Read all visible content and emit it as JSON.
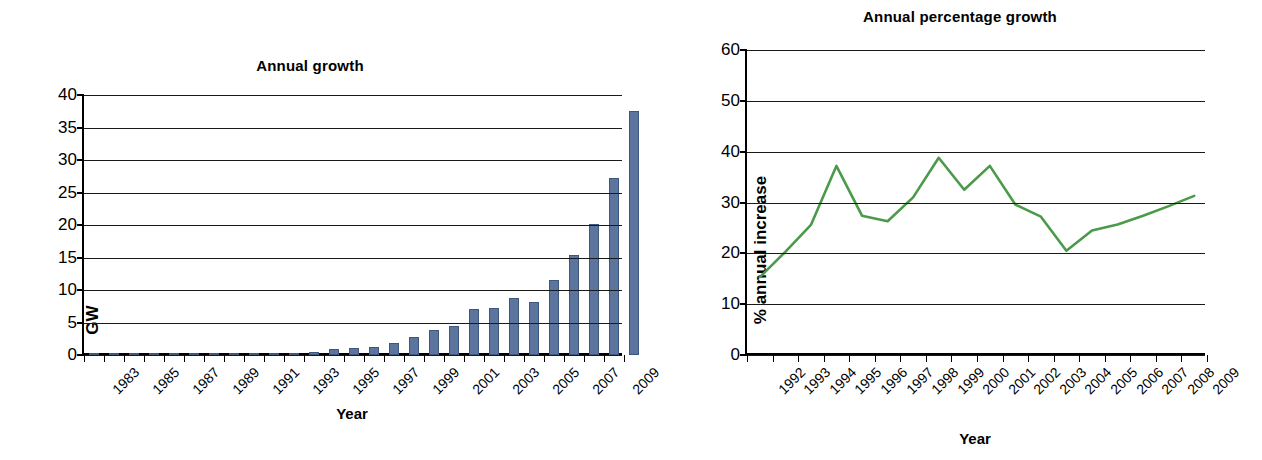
{
  "colors": {
    "bar_fill": "#5b759f",
    "bar_stroke": "#3f567d",
    "line": "#4a9a4a",
    "axis": "#000000",
    "grid": "#1a1a1a",
    "background": "#ffffff"
  },
  "left": {
    "title": "Annual growth",
    "xlabel": "Year",
    "ylabel": "GW"
  },
  "right": {
    "title": "Annual percentage growth",
    "xlabel": "Year",
    "ylabel": "% annual increase"
  },
  "chart_data": [
    {
      "type": "bar",
      "title": "Annual growth",
      "xlabel": "Year",
      "ylabel": "GW",
      "ylim": [
        0,
        40
      ],
      "yticks": [
        0,
        5,
        10,
        15,
        20,
        25,
        30,
        35,
        40
      ],
      "grid": true,
      "legend": "none",
      "xtick_labels": [
        "1983",
        "",
        "1985",
        "",
        "1987",
        "",
        "1989",
        "",
        "1991",
        "",
        "1993",
        "",
        "1995",
        "",
        "1997",
        "",
        "1999",
        "",
        "2001",
        "",
        "2003",
        "",
        "2005",
        "",
        "2007",
        "",
        "2009"
      ],
      "categories": [
        1983,
        1984,
        1985,
        1986,
        1987,
        1988,
        1989,
        1990,
        1991,
        1992,
        1993,
        1994,
        1995,
        1996,
        1997,
        1998,
        1999,
        2000,
        2001,
        2002,
        2003,
        2004,
        2005,
        2006,
        2007,
        2008,
        2009
      ],
      "values": [
        0.05,
        0.05,
        0.06,
        0.07,
        0.08,
        0.09,
        0.1,
        0.12,
        0.15,
        0.2,
        0.3,
        0.5,
        0.9,
        1.1,
        1.3,
        1.8,
        2.8,
        3.9,
        4.5,
        7.1,
        7.3,
        8.7,
        8.2,
        11.6,
        15.4,
        20.1,
        27.2
      ]
    },
    {
      "type": "line",
      "title": "Annual percentage growth",
      "xlabel": "Year",
      "ylabel": "% annual increase",
      "ylim": [
        0,
        60
      ],
      "yticks": [
        0,
        10,
        20,
        30,
        40,
        50,
        60
      ],
      "grid": true,
      "legend": "none",
      "categories": [
        1992,
        1993,
        1994,
        1995,
        1996,
        1997,
        1998,
        1999,
        2000,
        2001,
        2002,
        2003,
        2004,
        2005,
        2006,
        2007,
        2008,
        2009
      ],
      "xtick_labels": [
        "1992",
        "1993",
        "1994",
        "1995",
        "1996",
        "1997",
        "1998",
        "1999",
        "2000",
        "2001",
        "2002",
        "2003",
        "2004",
        "2005",
        "2006",
        "2007",
        "2008",
        "2009"
      ],
      "values": [
        15.3,
        20.3,
        25.6,
        37.2,
        27.4,
        26.3,
        31.0,
        38.8,
        32.5,
        37.2,
        29.6,
        27.2,
        20.5,
        24.5,
        25.7,
        27.4,
        29.3,
        31.3
      ]
    }
  ],
  "left_last_bar_value": 37.5
}
